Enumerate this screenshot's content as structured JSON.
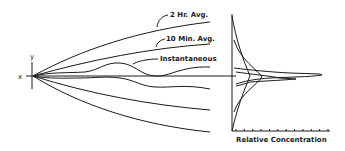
{
  "diagram": {
    "axis_labels": {
      "x": "x",
      "y": "y",
      "concentration": "Relative Concentration"
    },
    "curve_labels": {
      "two_hour": "2 Hr. Avg.",
      "ten_minute": "10 Min. Avg.",
      "instantaneous": "Instantaneous"
    },
    "profile_tick_count": 12,
    "colors": {
      "ink": "#1a1a1a",
      "background": "#ffffff"
    }
  }
}
